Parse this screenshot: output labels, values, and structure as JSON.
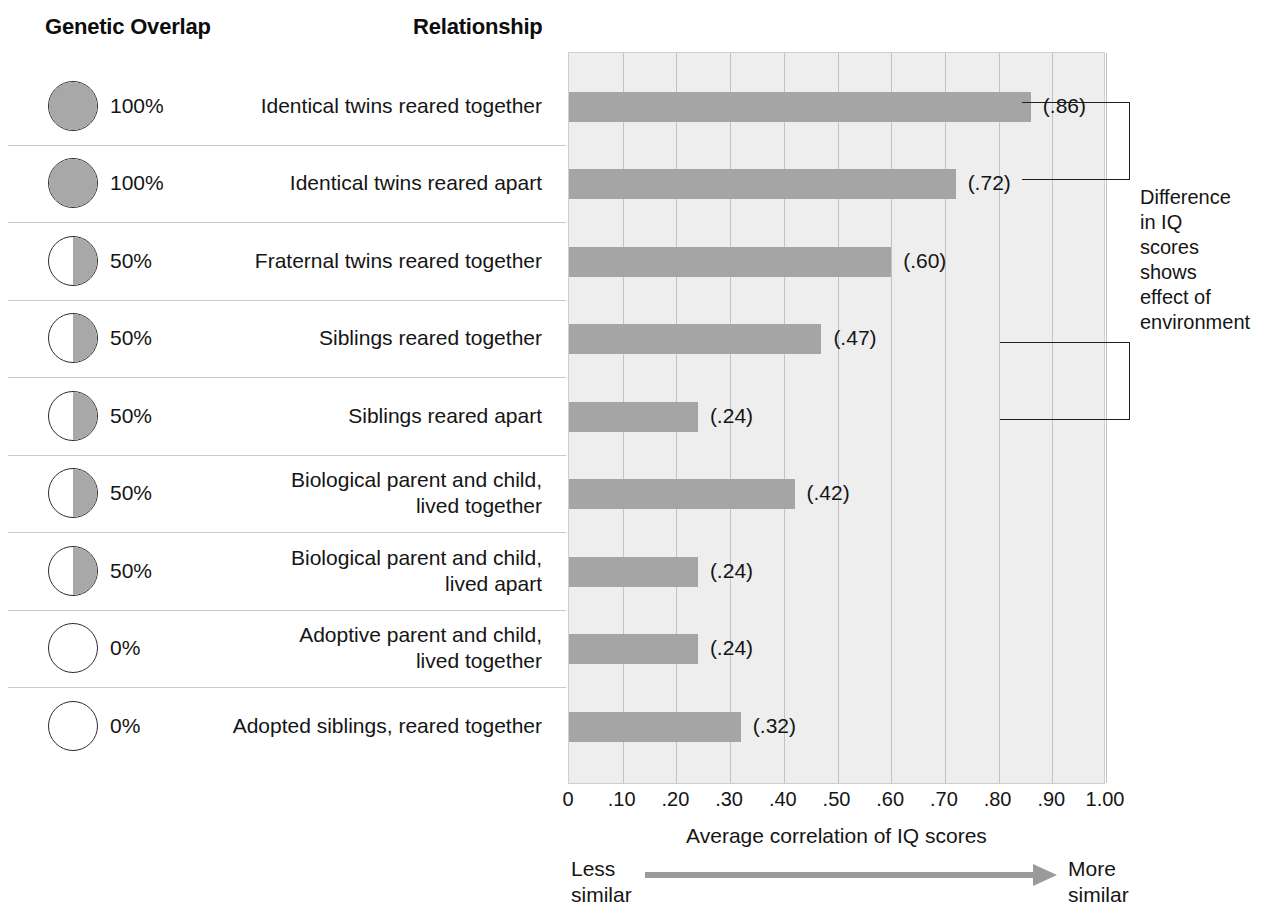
{
  "headers": {
    "genetic_overlap": "Genetic Overlap",
    "relationship": "Relationship"
  },
  "annotation": {
    "text": "Difference\nin IQ\nscores\nshows\neffect of\nenvironment"
  },
  "axis": {
    "title": "Average correlation of IQ scores",
    "less_similar": "Less\nsimilar",
    "more_similar": "More\nsimilar",
    "ticks": [
      "0",
      ".10",
      ".20",
      ".30",
      ".40",
      ".50",
      ".60",
      ".70",
      ".80",
      ".90",
      "1.00"
    ]
  },
  "chart_data": {
    "type": "bar",
    "orientation": "horizontal",
    "title": "",
    "xlabel": "Average correlation of IQ scores",
    "ylabel": "",
    "xlim": [
      0,
      1.0
    ],
    "xticks": [
      0,
      0.1,
      0.2,
      0.3,
      0.4,
      0.5,
      0.6,
      0.7,
      0.8,
      0.9,
      1.0
    ],
    "grid": true,
    "legend": "none",
    "bar_color": "#a5a5a5",
    "plot_background": "#eeeeee",
    "categories": [
      "Identical twins reared together",
      "Identical twins reared apart",
      "Fraternal twins reared together",
      "Siblings reared together",
      "Siblings reared apart",
      "Biological parent and child, lived together",
      "Biological parent and child, lived apart",
      "Adoptive parent and child, lived together",
      "Adopted siblings, reared together"
    ],
    "values": [
      0.86,
      0.72,
      0.6,
      0.47,
      0.24,
      0.42,
      0.24,
      0.24,
      0.32
    ],
    "value_labels": [
      "(.86)",
      "(.72)",
      "(.60)",
      "(.47)",
      "(.24)",
      "(.42)",
      "(.24)",
      "(.24)",
      "(.32)"
    ],
    "genetic_overlap": [
      "100%",
      "100%",
      "50%",
      "50%",
      "50%",
      "50%",
      "50%",
      "0%",
      "0%"
    ]
  },
  "rows": [
    {
      "genetic_overlap": "100%",
      "fill": "full",
      "relationship": "Identical twins reared together",
      "value_label": "(.86)",
      "value": 0.86
    },
    {
      "genetic_overlap": "100%",
      "fill": "full",
      "relationship": "Identical twins reared apart",
      "value_label": "(.72)",
      "value": 0.72
    },
    {
      "genetic_overlap": "50%",
      "fill": "half",
      "relationship": "Fraternal twins reared together",
      "value_label": "(.60)",
      "value": 0.6
    },
    {
      "genetic_overlap": "50%",
      "fill": "half",
      "relationship": "Siblings reared together",
      "value_label": "(.47)",
      "value": 0.47
    },
    {
      "genetic_overlap": "50%",
      "fill": "half",
      "relationship": "Siblings reared apart",
      "value_label": "(.24)",
      "value": 0.24
    },
    {
      "genetic_overlap": "50%",
      "fill": "half",
      "relationship": "Biological parent and child,\nlived together",
      "value_label": "(.42)",
      "value": 0.42
    },
    {
      "genetic_overlap": "50%",
      "fill": "half",
      "relationship": "Biological parent and child,\nlived apart",
      "value_label": "(.24)",
      "value": 0.24
    },
    {
      "genetic_overlap": "0%",
      "fill": "none",
      "relationship": "Adoptive parent and child,\nlived together",
      "value_label": "(.24)",
      "value": 0.24
    },
    {
      "genetic_overlap": "0%",
      "fill": "none",
      "relationship": "Adopted siblings, reared together",
      "value_label": "(.32)",
      "value": 0.32
    }
  ]
}
